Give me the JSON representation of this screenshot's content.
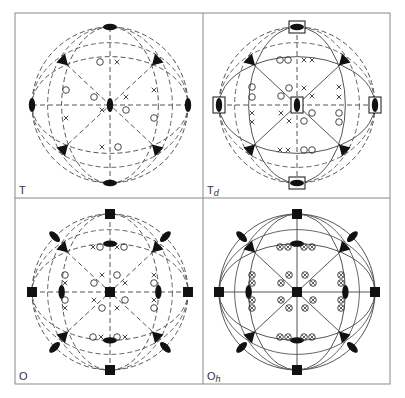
{
  "figure": {
    "colors": {
      "line": "#555555",
      "symbol": "#111111",
      "frame": "#888888",
      "background": "#ffffff"
    },
    "panels": [
      {
        "id": "T",
        "label": "T",
        "sub": "",
        "col": 0,
        "row": 0,
        "style": "dashed",
        "twofold_boxes": false,
        "fourfold": false,
        "points": "T"
      },
      {
        "id": "Td",
        "label": "T",
        "sub": "d",
        "col": 1,
        "row": 0,
        "style": "mixed",
        "twofold_boxes": true,
        "fourfold": false,
        "points": "Td"
      },
      {
        "id": "O",
        "label": "O",
        "sub": "",
        "col": 0,
        "row": 1,
        "style": "dashed",
        "twofold_boxes": false,
        "fourfold": true,
        "points": "O"
      },
      {
        "id": "Oh",
        "label": "O",
        "sub": "h",
        "col": 1,
        "row": 1,
        "style": "solid",
        "twofold_boxes": false,
        "fourfold": true,
        "points": "Oh"
      }
    ],
    "legend": {
      "circle": "point below plane",
      "cross": "point above plane",
      "circled_cross": "coincident points",
      "triangle": "3-fold axis",
      "lens": "2-fold axis",
      "square": "4-fold axis"
    }
  }
}
